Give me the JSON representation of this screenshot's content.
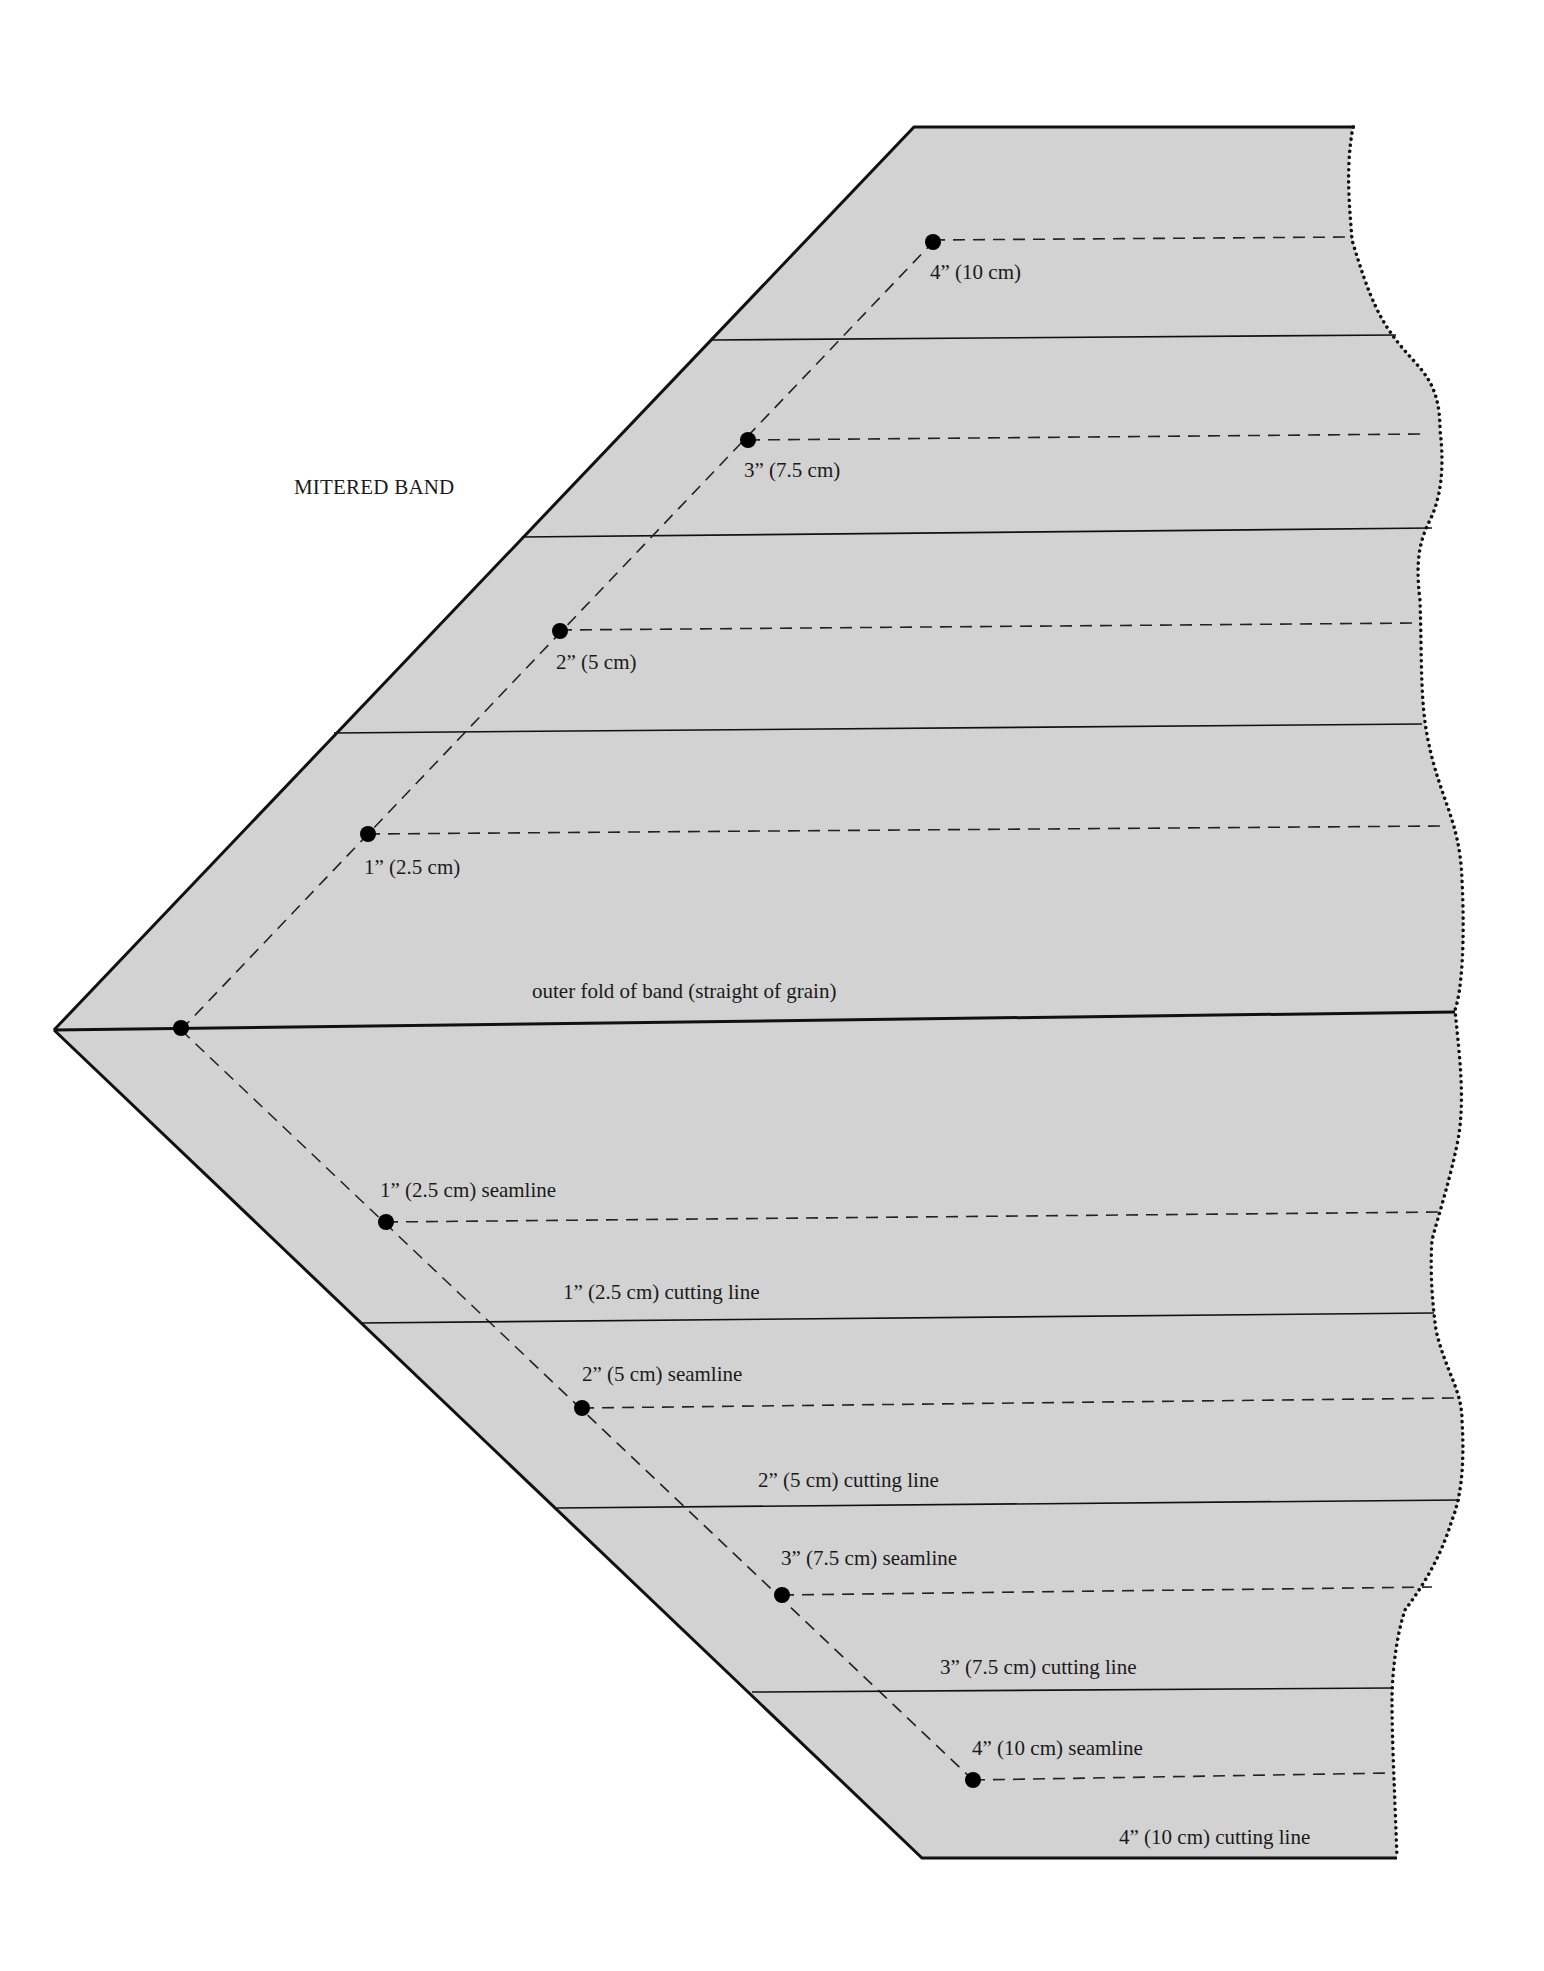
{
  "title": "MITERED BAND",
  "colors": {
    "fabric_fill": "#d2d2d2",
    "line": "#111111",
    "background": "#ffffff"
  },
  "fold_label": "outer fold of band (straight of grain)",
  "upper_labels": [
    {
      "text": "4” (10 cm)",
      "x": 930,
      "y": 262
    },
    {
      "text": "3” (7.5 cm)",
      "x": 744,
      "y": 460
    },
    {
      "text": "2” (5 cm)",
      "x": 556,
      "y": 652
    },
    {
      "text": "1” (2.5 cm)",
      "x": 364,
      "y": 857
    }
  ],
  "lower_labels": [
    {
      "text": "1” (2.5 cm) seamline",
      "x": 380,
      "y": 1180
    },
    {
      "text": "1” (2.5 cm) cutting line",
      "x": 563,
      "y": 1282
    },
    {
      "text": "2” (5 cm) seamline",
      "x": 582,
      "y": 1364
    },
    {
      "text": "2” (5 cm) cutting line",
      "x": 758,
      "y": 1470
    },
    {
      "text": "3” (7.5 cm) seamline",
      "x": 781,
      "y": 1548
    },
    {
      "text": "3” (7.5 cm) cutting line",
      "x": 940,
      "y": 1657
    },
    {
      "text": "4” (10 cm) seamline",
      "x": 972,
      "y": 1738
    },
    {
      "text": "4” (10 cm) cutting line",
      "x": 1119,
      "y": 1827
    }
  ]
}
